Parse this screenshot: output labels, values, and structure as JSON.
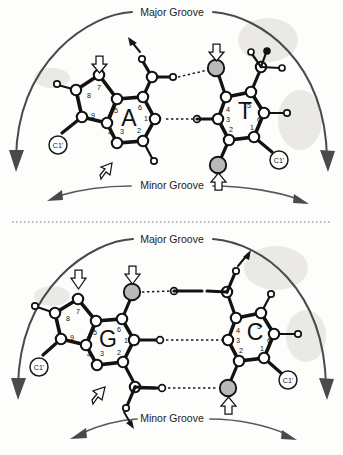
{
  "figure": {
    "title_visible": false,
    "panels": [
      {
        "id": "at-pair",
        "pair_label": "A-T",
        "major_groove_label": "Major Groove",
        "minor_groove_label": "Minor Groove",
        "bases": [
          {
            "letter": "A",
            "name": "adenine",
            "side": "left",
            "ring_numbers": [
              "1",
              "2",
              "3",
              "4",
              "5",
              "6",
              "7",
              "8",
              "9"
            ],
            "sugar_label": "C1'"
          },
          {
            "letter": "T",
            "name": "thymine",
            "side": "right",
            "ring_numbers": [
              "1",
              "2",
              "3",
              "4",
              "5",
              "6"
            ],
            "sugar_label": "C1'"
          }
        ],
        "hydrogen_bond_count": 2,
        "donor_acceptor_markers": 4
      },
      {
        "id": "gc-pair",
        "pair_label": "G-C",
        "major_groove_label": "Major Groove",
        "minor_groove_label": "Minor Groove",
        "bases": [
          {
            "letter": "G",
            "name": "guanine",
            "side": "left",
            "ring_numbers": [
              "1",
              "2",
              "3",
              "4",
              "5",
              "6",
              "7",
              "8",
              "9"
            ],
            "sugar_label": "C1'"
          },
          {
            "letter": "C",
            "name": "cytosine",
            "side": "right",
            "ring_numbers": [
              "1",
              "2",
              "3",
              "4",
              "5",
              "6"
            ],
            "sugar_label": "C1'"
          }
        ],
        "hydrogen_bond_count": 3,
        "donor_acceptor_markers": 4
      }
    ],
    "colors": {
      "line": "#121212",
      "atom_open_fill": "#ffffff",
      "atom_grey_fill": "#b9b9b9",
      "groove_arrow": "#4a4a4a",
      "background": "#fdfdfc"
    }
  }
}
